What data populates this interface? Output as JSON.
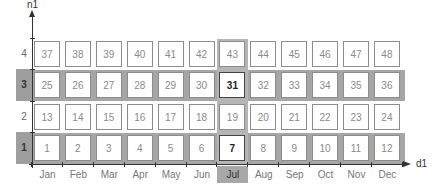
{
  "axes": {
    "x_label": "d1",
    "y_label": "n1"
  },
  "columns": [
    "Jan",
    "Feb",
    "Mar",
    "Apr",
    "May",
    "Jun",
    "Jul",
    "Aug",
    "Sep",
    "Oct",
    "Nov",
    "Dec"
  ],
  "rows": [
    {
      "label": "4",
      "highlighted": false,
      "values": [
        "37",
        "38",
        "39",
        "40",
        "41",
        "42",
        "43",
        "44",
        "45",
        "46",
        "47",
        "48"
      ]
    },
    {
      "label": "3",
      "highlighted": true,
      "values": [
        "25",
        "26",
        "27",
        "28",
        "29",
        "30",
        "31",
        "32",
        "33",
        "34",
        "35",
        "36"
      ]
    },
    {
      "label": "2",
      "highlighted": false,
      "values": [
        "13",
        "14",
        "15",
        "16",
        "17",
        "18",
        "19",
        "20",
        "21",
        "22",
        "23",
        "24"
      ]
    },
    {
      "label": "1",
      "highlighted": true,
      "values": [
        "1",
        "2",
        "3",
        "4",
        "5",
        "6",
        "7",
        "8",
        "9",
        "10",
        "11",
        "12"
      ]
    }
  ],
  "highlighted_column": "Jul",
  "selected_cells": [
    "31",
    "7"
  ],
  "colors": {
    "band": "#a6a6a6",
    "cell_border": "#8c8c8c",
    "selected_border": "#444444",
    "axis": "#333333"
  }
}
